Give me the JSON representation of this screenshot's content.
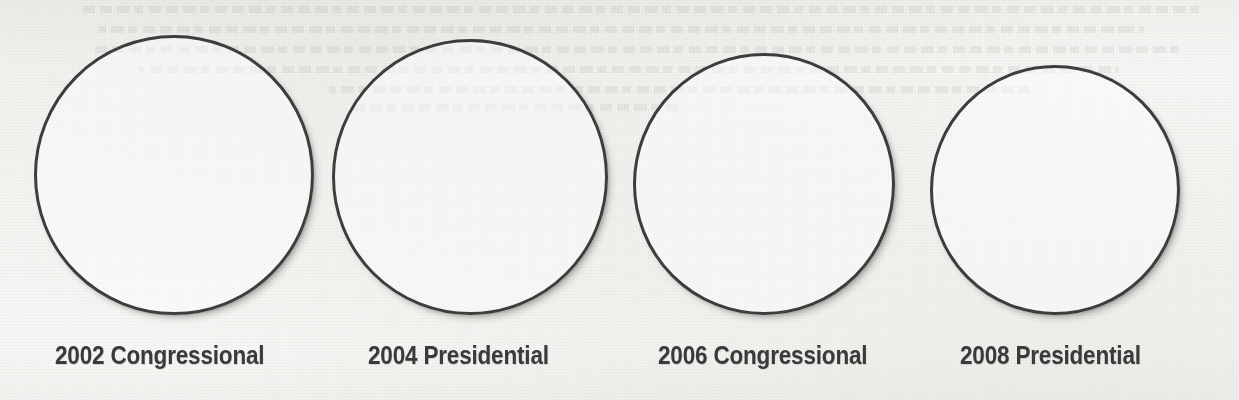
{
  "page": {
    "background_color": "#f7f7f5",
    "medium": "scanned-paper"
  },
  "style": {
    "circle_stroke_color": "#3d3d3d",
    "label_text_color": "#3a3a3a",
    "shadow_color": "#6e6c66"
  },
  "chart_data": {
    "type": "bar",
    "title": "",
    "subtitle": "",
    "xlabel": "",
    "ylabel": "",
    "legend": [],
    "annotations": [],
    "grid": false,
    "note": "Four empty outlined circles (unfilled pie/proportional-area placeholders), one per election cycle. No values, percentages, slices or shading are printed inside any circle.",
    "categories": [
      "2002 Congressional",
      "2004 Presidential",
      "2006 Congressional",
      "2008 Presidential"
    ],
    "values": [
      null,
      null,
      null,
      null
    ],
    "marker_diameters_px": [
      280,
      276,
      262,
      250
    ]
  },
  "circles": [
    {
      "label": "2002 Congressional",
      "name": "circle-2002-congressional",
      "left": 34,
      "top": 35,
      "size": 280,
      "label_left": 55
    },
    {
      "label": "2004 Presidential",
      "name": "circle-2004-presidential",
      "left": 332,
      "top": 39,
      "size": 276,
      "label_left": 368
    },
    {
      "label": "2006 Congressional",
      "name": "circle-2006-congressional",
      "left": 633,
      "top": 53,
      "size": 262,
      "label_left": 658
    },
    {
      "label": "2008 Presidential",
      "name": "circle-2008-presidential",
      "left": 930,
      "top": 65,
      "size": 250,
      "label_left": 960
    }
  ],
  "ghost_text": {
    "description": "illegible reversed bleed-through text from the opposite side of the page",
    "lines": [
      {
        "left": 40,
        "top": 6,
        "width": 1120
      },
      {
        "left": 95,
        "top": 26,
        "width": 1045
      },
      {
        "left": 60,
        "top": 46,
        "width": 1090
      },
      {
        "left": 120,
        "top": 66,
        "width": 980
      },
      {
        "left": 210,
        "top": 86,
        "width": 700
      },
      {
        "left": 560,
        "top": 104,
        "width": 330
      }
    ]
  }
}
